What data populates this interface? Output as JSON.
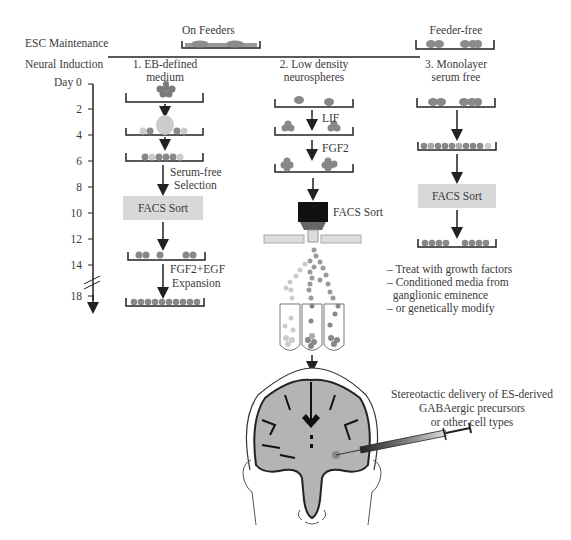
{
  "header": {
    "esc_maintenance": "ESC Maintenance",
    "neural_induction": "Neural Induction",
    "on_feeders": "On Feeders",
    "feeder_free": "Feeder-free"
  },
  "timeline": {
    "label": "Day 0",
    "ticks": [
      "2",
      "4",
      "6",
      "8",
      "10",
      "12",
      "14",
      "18"
    ]
  },
  "methods": [
    {
      "title_line1": "1. EB-defined",
      "title_line2": "medium",
      "step1_line1": "Serum-free",
      "step1_line2": "Selection",
      "sort_label": "FACS Sort",
      "step2_line1": "FGF2+EGF",
      "step2_line2": "Expansion"
    },
    {
      "title_line1": "2. Low density",
      "title_line2": "neurospheres",
      "step1": "LIF",
      "step2": "FGF2",
      "sort_label": "FACS Sort"
    },
    {
      "title_line1": "3. Monolayer",
      "title_line2": "serum free",
      "sort_label": "FACS Sort",
      "notes": [
        "– Treat with growth factors",
        "– Conditioned media from",
        "  ganglionic eminence",
        "– or genetically modify"
      ]
    }
  ],
  "delivery": {
    "line1": "Stereotactic delivery of ES-derived",
    "line2": "GABAergic precursors",
    "line3": "or other cell types"
  },
  "colors": {
    "cell": "#8c8c8c",
    "cell_light": "#c8c8c8",
    "box": "#d8d8d8",
    "brain": "#b4b4b4",
    "line": "#222222"
  }
}
